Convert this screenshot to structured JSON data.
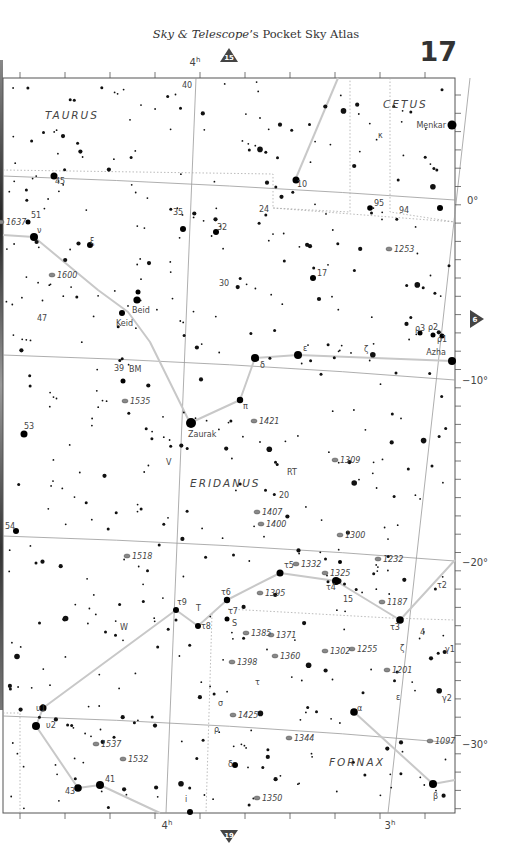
{
  "header": {
    "title_italic_1": "Sky & Telescope",
    "title_mid": "’s Pocket Sky Atlas",
    "page_number": "17"
  },
  "navigation": {
    "top_arrow": {
      "label": "15",
      "direction": "up"
    },
    "bottom_arrow": {
      "label": "19",
      "direction": "down"
    },
    "right_arrow": {
      "label": "6",
      "direction": "right"
    }
  },
  "axes": {
    "ra_labels": [
      {
        "text": "4h",
        "x": 195,
        "y": 66,
        "pos": "top"
      },
      {
        "text": "4h",
        "x": 167,
        "y": 829,
        "pos": "bottom"
      },
      {
        "text": "3h",
        "x": 390,
        "y": 829,
        "pos": "bottom"
      }
    ],
    "dec_labels": [
      {
        "text": "0°",
        "x": 467,
        "y": 204
      },
      {
        "text": "−10°",
        "x": 462,
        "y": 384
      },
      {
        "text": "−20°",
        "x": 462,
        "y": 566
      },
      {
        "text": "−30°",
        "x": 462,
        "y": 748
      }
    ]
  },
  "constellations": [
    {
      "name": "TAURUS",
      "x": 45,
      "y": 119
    },
    {
      "name": "CETUS",
      "x": 383,
      "y": 108
    },
    {
      "name": "ERIDANUS",
      "x": 190,
      "y": 487
    },
    {
      "name": "FORNAX",
      "x": 329,
      "y": 766
    }
  ],
  "named_stars": [
    {
      "name": "Menkar",
      "greek": "α",
      "x": 452,
      "y": 125
    },
    {
      "name": "Beid",
      "greek": "ο1",
      "x": 137,
      "y": 301
    },
    {
      "name": "Keid",
      "greek": "ο2",
      "x": 122,
      "y": 314
    },
    {
      "name": "Zaurak",
      "greek": "γ",
      "x": 191,
      "y": 423
    },
    {
      "name": "Azha",
      "greek": "η",
      "x": 452,
      "y": 360
    }
  ],
  "star_labels": [
    {
      "t": "40",
      "x": 182,
      "y": 88
    },
    {
      "t": "κ",
      "x": 378,
      "y": 138
    },
    {
      "t": "10",
      "x": 297,
      "y": 187
    },
    {
      "t": "45",
      "x": 55,
      "y": 184
    },
    {
      "t": "35",
      "x": 173,
      "y": 215
    },
    {
      "t": "24",
      "x": 259,
      "y": 212
    },
    {
      "t": "95",
      "x": 374,
      "y": 206
    },
    {
      "t": "94",
      "x": 399,
      "y": 213
    },
    {
      "t": "32",
      "x": 217,
      "y": 230
    },
    {
      "t": "51",
      "x": 31,
      "y": 218
    },
    {
      "t": "ν",
      "x": 37,
      "y": 233
    },
    {
      "t": "ξ",
      "x": 90,
      "y": 244
    },
    {
      "t": "17",
      "x": 317,
      "y": 276
    },
    {
      "t": "30",
      "x": 219,
      "y": 286
    },
    {
      "t": "47",
      "x": 37,
      "y": 321
    },
    {
      "t": "ρ3",
      "x": 415,
      "y": 331
    },
    {
      "t": "ρ2",
      "x": 428,
      "y": 330
    },
    {
      "t": "ρ1",
      "x": 437,
      "y": 342
    },
    {
      "t": "ζ",
      "x": 364,
      "y": 352
    },
    {
      "t": "ε",
      "x": 303,
      "y": 351
    },
    {
      "t": "δ",
      "x": 260,
      "y": 368
    },
    {
      "t": "39",
      "x": 114,
      "y": 371
    },
    {
      "t": "BM",
      "x": 129,
      "y": 372
    },
    {
      "t": "π",
      "x": 243,
      "y": 409
    },
    {
      "t": "53",
      "x": 24,
      "y": 429
    },
    {
      "t": "V",
      "x": 166,
      "y": 465
    },
    {
      "t": "RT",
      "x": 287,
      "y": 475
    },
    {
      "t": "20",
      "x": 279,
      "y": 498
    },
    {
      "t": "54",
      "x": 5,
      "y": 529
    },
    {
      "t": "τ5",
      "x": 284,
      "y": 568
    },
    {
      "t": "τ4",
      "x": 326,
      "y": 590
    },
    {
      "t": "15",
      "x": 343,
      "y": 602
    },
    {
      "t": "τ2",
      "x": 437,
      "y": 588
    },
    {
      "t": "τ6",
      "x": 221,
      "y": 595
    },
    {
      "t": "τ7",
      "x": 228,
      "y": 614
    },
    {
      "t": "S",
      "x": 232,
      "y": 626
    },
    {
      "t": "τ9",
      "x": 177,
      "y": 605
    },
    {
      "t": "T",
      "x": 196,
      "y": 611
    },
    {
      "t": "τ8",
      "x": 201,
      "y": 629
    },
    {
      "t": "τ3",
      "x": 390,
      "y": 630
    },
    {
      "t": "4",
      "x": 420,
      "y": 635
    },
    {
      "t": "W",
      "x": 120,
      "y": 630
    },
    {
      "t": "ζ",
      "x": 400,
      "y": 651
    },
    {
      "t": "γ1",
      "x": 445,
      "y": 652
    },
    {
      "t": "τ",
      "x": 255,
      "y": 685
    },
    {
      "t": "σ",
      "x": 218,
      "y": 706
    },
    {
      "t": "ε",
      "x": 396,
      "y": 700
    },
    {
      "t": "γ2",
      "x": 442,
      "y": 701
    },
    {
      "t": "υ1",
      "x": 36,
      "y": 711
    },
    {
      "t": "υ2",
      "x": 46,
      "y": 728
    },
    {
      "t": "ρ",
      "x": 214,
      "y": 732
    },
    {
      "t": "α",
      "x": 357,
      "y": 711
    },
    {
      "t": "δ",
      "x": 228,
      "y": 767
    },
    {
      "t": "41",
      "x": 105,
      "y": 782
    },
    {
      "t": "43",
      "x": 65,
      "y": 794
    },
    {
      "t": "i",
      "x": 185,
      "y": 802
    },
    {
      "t": "β",
      "x": 433,
      "y": 799
    }
  ],
  "deep_sky_objects": [
    {
      "id": "1637",
      "x": 4,
      "y": 225
    },
    {
      "id": "1253",
      "x": 392,
      "y": 252
    },
    {
      "id": "1600",
      "x": 55,
      "y": 278
    },
    {
      "id": "1535",
      "x": 128,
      "y": 404
    },
    {
      "id": "1421",
      "x": 257,
      "y": 424
    },
    {
      "id": "1309",
      "x": 338,
      "y": 463
    },
    {
      "id": "1407",
      "x": 260,
      "y": 515
    },
    {
      "id": "1400",
      "x": 264,
      "y": 527
    },
    {
      "id": "1300",
      "x": 343,
      "y": 538
    },
    {
      "id": "1518",
      "x": 130,
      "y": 559
    },
    {
      "id": "1232",
      "x": 381,
      "y": 562
    },
    {
      "id": "1332",
      "x": 299,
      "y": 567
    },
    {
      "id": "1325",
      "x": 328,
      "y": 576
    },
    {
      "id": "1395",
      "x": 263,
      "y": 596
    },
    {
      "id": "1187",
      "x": 385,
      "y": 605
    },
    {
      "id": "1385",
      "x": 249,
      "y": 636
    },
    {
      "id": "1371",
      "x": 274,
      "y": 638
    },
    {
      "id": "1360",
      "x": 278,
      "y": 659
    },
    {
      "id": "1302",
      "x": 328,
      "y": 654
    },
    {
      "id": "1255",
      "x": 355,
      "y": 652
    },
    {
      "id": "1398",
      "x": 235,
      "y": 665
    },
    {
      "id": "1201",
      "x": 390,
      "y": 673
    },
    {
      "id": "1425",
      "x": 236,
      "y": 718
    },
    {
      "id": "1097",
      "x": 433,
      "y": 744
    },
    {
      "id": "1537",
      "x": 99,
      "y": 747
    },
    {
      "id": "1344",
      "x": 292,
      "y": 741
    },
    {
      "id": "1532",
      "x": 126,
      "y": 762
    },
    {
      "id": "1350",
      "x": 260,
      "y": 801
    }
  ]
}
